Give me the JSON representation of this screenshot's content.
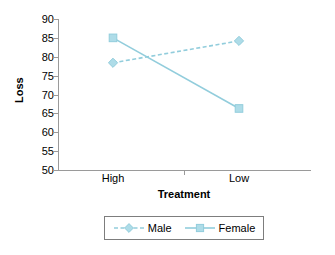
{
  "chart_data": {
    "type": "line",
    "title": "",
    "xlabel": "Treatment",
    "ylabel": "Loss",
    "categories": [
      "High",
      "Low"
    ],
    "series": [
      {
        "name": "Male",
        "values": [
          78.4,
          84.2
        ],
        "marker": "diamond",
        "line_style": "dashed",
        "color": "#92CDDC"
      },
      {
        "name": "Female",
        "values": [
          85.0,
          66.3
        ],
        "marker": "square",
        "line_style": "solid",
        "color": "#92CDDC"
      }
    ],
    "ylim": [
      50,
      90
    ],
    "yticks": [
      90,
      85,
      80,
      75,
      70,
      65,
      60,
      55,
      50
    ],
    "ytick_labels": [
      "90",
      "85",
      "80",
      "75",
      "70",
      "65",
      "60",
      "55",
      "50"
    ],
    "grid": false,
    "legend_position": "bottom",
    "axis_color": "#9a9a9a",
    "accent_color": "#92CDDC",
    "marker_fill": "#AEDCE8",
    "background": "#ffffff"
  },
  "legend": {
    "entries": [
      {
        "label": "Male"
      },
      {
        "label": "Female"
      }
    ]
  }
}
